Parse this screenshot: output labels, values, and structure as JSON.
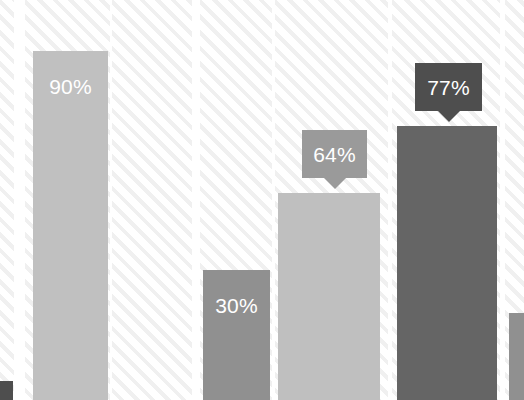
{
  "chart": {
    "title": "",
    "subtitle": "",
    "xlabel": "",
    "ylabel": ""
  },
  "colors": {
    "background": "#ffffff",
    "hatch_line": "#f0f0f0",
    "bar_light": "#c0c0c0",
    "bar_light_alt": "#bfbfbf",
    "bar_medium": "#909090",
    "bar_dark": "#656565",
    "callout_medium": "#9a9a9a",
    "callout_dark": "#4e4e4e",
    "label_text": "#ffffff"
  },
  "bars": [
    {
      "id": "bar-1",
      "label": "90%",
      "value": 90,
      "label_style": "inside",
      "color": "#c0c0c0",
      "left": 33,
      "width": 75,
      "top": 51
    },
    {
      "id": "bar-2",
      "label": "30%",
      "value": 30,
      "label_style": "inside",
      "color": "#909090",
      "left": 203,
      "width": 67,
      "top": 270
    },
    {
      "id": "bar-3",
      "label": "64%",
      "value": 64,
      "label_style": "callout",
      "color": "#bfbfbf",
      "callout_color": "#9a9a9a",
      "left": 278,
      "width": 102,
      "top": 193,
      "callout_left": 302,
      "callout_top": 130,
      "callout_width": 65,
      "callout_height": 48
    },
    {
      "id": "bar-4",
      "label": "77%",
      "value": 77,
      "label_style": "callout",
      "color": "#656565",
      "callout_color": "#4e4e4e",
      "left": 397,
      "width": 100,
      "top": 126,
      "callout_left": 415,
      "callout_top": 63,
      "callout_width": 67,
      "callout_height": 48
    },
    {
      "id": "bar-5",
      "label": "",
      "value": null,
      "label_style": "none",
      "color": "#909090",
      "left": 509,
      "width": 15,
      "top": 313
    }
  ],
  "hatch_bands": [
    {
      "id": "band-0",
      "left": 0,
      "width": 14
    },
    {
      "id": "band-1",
      "left": 25,
      "width": 85
    },
    {
      "id": "band-2",
      "left": 112,
      "width": 80
    },
    {
      "id": "band-3",
      "left": 200,
      "width": 72
    },
    {
      "id": "band-4",
      "left": 275,
      "width": 113
    },
    {
      "id": "band-5",
      "left": 392,
      "width": 108
    },
    {
      "id": "band-6",
      "left": 505,
      "width": 19
    }
  ],
  "corner_chip": {
    "id": "corner-chip",
    "label": "",
    "color": "#4e4e4e",
    "left": 0,
    "top": 381,
    "width": 13,
    "height": 19
  },
  "chart_data": {
    "type": "bar",
    "title": "",
    "xlabel": "",
    "ylabel": "",
    "categories": [
      "1",
      "2",
      "3",
      "4",
      "5"
    ],
    "values": [
      90,
      30,
      64,
      77,
      null
    ],
    "data_labels": [
      "90%",
      "30%",
      "64%",
      "77%",
      ""
    ],
    "unit": "%",
    "ylim": [
      0,
      100
    ],
    "grid": false,
    "legend": false,
    "legend_position": "none"
  }
}
